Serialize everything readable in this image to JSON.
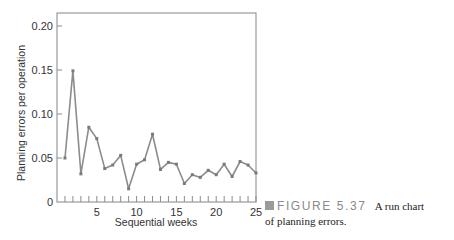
{
  "chart_data": {
    "type": "line",
    "title": "",
    "xlabel": "Sequential weeks",
    "ylabel": "Planning errors per operation",
    "x": [
      1,
      2,
      3,
      4,
      5,
      6,
      7,
      8,
      9,
      10,
      11,
      12,
      13,
      14,
      15,
      16,
      17,
      18,
      19,
      20,
      21,
      22,
      23,
      24,
      25
    ],
    "values": [
      0.05,
      0.149,
      0.032,
      0.085,
      0.072,
      0.038,
      0.042,
      0.053,
      0.015,
      0.043,
      0.048,
      0.077,
      0.037,
      0.045,
      0.043,
      0.021,
      0.031,
      0.028,
      0.036,
      0.031,
      0.043,
      0.029,
      0.046,
      0.042,
      0.033
    ],
    "xlim": [
      0,
      25
    ],
    "ylim": [
      0,
      0.22
    ],
    "x_tick_labels": [
      "5",
      "10",
      "15",
      "20",
      "25"
    ],
    "y_tick_labels": [
      "0",
      "0.05",
      "0.10",
      "0.15",
      "0.20"
    ],
    "grid": false,
    "legend": null,
    "line_color": "#8c8c8c"
  },
  "caption": {
    "figure_label": "FIGURE 5.37",
    "text_line1": "A run chart",
    "text_line2": "of planning errors."
  }
}
